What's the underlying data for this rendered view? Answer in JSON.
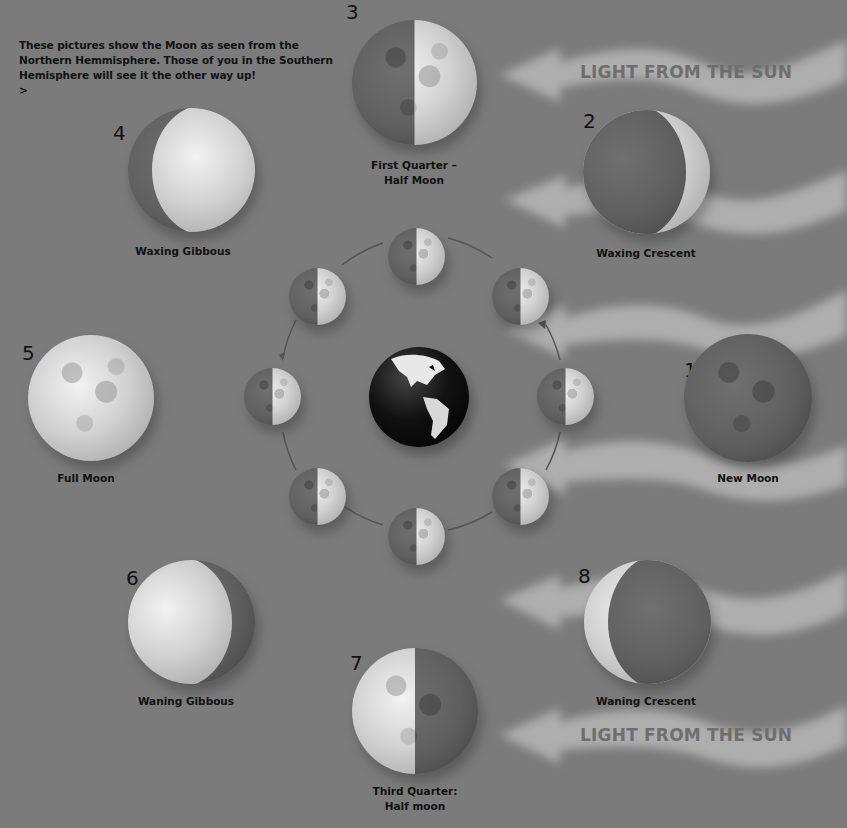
{
  "intro": {
    "lines": [
      "These pictures show the Moon as seen from the",
      "Northern Hemmisphere. Those of you in the Southern",
      "Hemisphere will see it the other way up!"
    ],
    "next_link": ">"
  },
  "sun_labels": {
    "top": "LIGHT FROM THE SUN",
    "bottom": "LIGHT FROM THE SUN"
  },
  "phases": [
    {
      "number": "1",
      "name": "New Moon"
    },
    {
      "number": "2",
      "name": "Waxing Crescent"
    },
    {
      "number": "3",
      "name_line1": "First Quarter –",
      "name_line2": "Half Moon"
    },
    {
      "number": "4",
      "name": "Waxing Gibbous"
    },
    {
      "number": "5",
      "name": "Full Moon"
    },
    {
      "number": "6",
      "name": "Waning Gibbous"
    },
    {
      "number": "7",
      "name_line1": "Third Quarter:",
      "name_line2": "Half moon"
    },
    {
      "number": "8",
      "name": "Waning Crescent"
    }
  ],
  "orbit": {
    "center": "earth",
    "moon_count": 8,
    "direction": "counter-clockwise"
  },
  "colors": {
    "background": "#7b7b7b",
    "text": "#111111",
    "sun_label": "#6e6e6e",
    "arrow": "#b8b8b8"
  }
}
